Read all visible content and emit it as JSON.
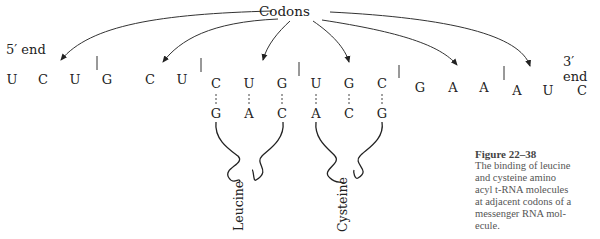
{
  "title_label": "Codons",
  "five_prime_label": "5′ end",
  "three_prime_label": "3′ end",
  "mrna": {
    "bases": [
      "U",
      "C",
      "U",
      "G",
      "C",
      "U",
      "C",
      "U",
      "G",
      "U",
      "G",
      "C",
      "G",
      "A",
      "A",
      "A",
      "U",
      "C"
    ],
    "x": [
      12,
      43,
      75,
      107,
      150,
      182,
      215,
      249,
      282,
      317,
      349,
      381,
      420,
      453,
      484,
      517,
      548,
      582
    ]
  },
  "codon_dividers_x": [
    97,
    201,
    299,
    399,
    504
  ],
  "anticodons": [
    {
      "amino_acid": "Leucine",
      "bases": [
        "G",
        "A",
        "C"
      ],
      "x": [
        215,
        249,
        282
      ]
    },
    {
      "amino_acid": "Cysteine",
      "bases": [
        "A",
        "C",
        "G"
      ],
      "x": [
        317,
        349,
        381
      ]
    }
  ],
  "caption": {
    "figure": "Figure 22–38",
    "lines": [
      "The binding of leucine",
      "and cysteine amino",
      "acyl t-RNA molecules",
      "at adjacent codons of a",
      "messenger RNA mol-",
      "ecule."
    ]
  }
}
